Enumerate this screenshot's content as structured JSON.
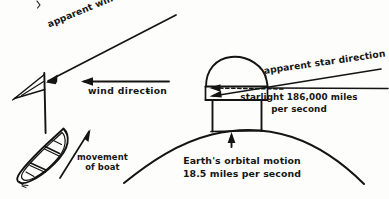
{
  "figure": {
    "background_color": "#fdfdfb",
    "ink_color": "#141414"
  },
  "labels": {
    "apparent_wind_direction": "apparent wind direction",
    "wind_direction": "wind direcŧion",
    "movement_of_boat_line1": "movement",
    "movement_of_boat_line2": "of boat",
    "apparent_star_direction": "apparent star direction",
    "starlight_line1": "starlight 186,000 miles",
    "starlight_line2": "per second",
    "earth_line1": "Earth's orbital motion",
    "earth_line2": "18.5 miles per second"
  },
  "diagram_elements": {
    "left_scene": "sailboat with mast and pennant showing wind vectors",
    "right_scene": "dome observatory telescope on curved Earth showing starlight vectors",
    "arrows": [
      "apparent-wind-arrow",
      "wind-direction-arrow",
      "movement-of-boat-arrow",
      "apparent-star-arrow",
      "starlight-arrow",
      "telescope-axis-dashed-arrow",
      "earth-motion-arrow"
    ]
  }
}
